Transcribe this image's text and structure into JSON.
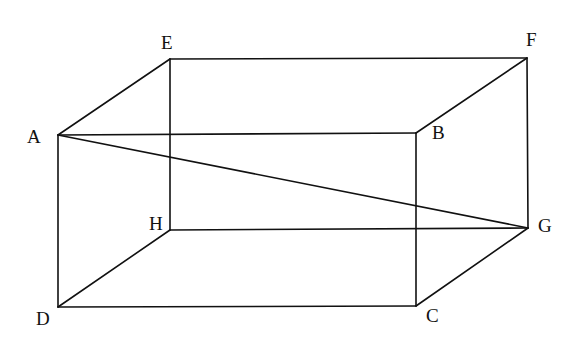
{
  "figure": {
    "type": "rectangular-prism",
    "stroke_color": "#111111",
    "background": "#ffffff"
  },
  "vertices": [
    {
      "name": "A",
      "x": 58,
      "y": 135,
      "label_x": 27,
      "label_y": 143
    },
    {
      "name": "B",
      "x": 416,
      "y": 133,
      "label_x": 432,
      "label_y": 139
    },
    {
      "name": "C",
      "x": 416,
      "y": 306,
      "label_x": 426,
      "label_y": 322
    },
    {
      "name": "D",
      "x": 58,
      "y": 307,
      "label_x": 36,
      "label_y": 325
    },
    {
      "name": "E",
      "x": 170,
      "y": 59,
      "label_x": 161,
      "label_y": 49
    },
    {
      "name": "F",
      "x": 527,
      "y": 58,
      "label_x": 526,
      "label_y": 46
    },
    {
      "name": "G",
      "x": 528,
      "y": 228,
      "label_x": 538,
      "label_y": 232
    },
    {
      "name": "H",
      "x": 170,
      "y": 230,
      "label_x": 149,
      "label_y": 230
    }
  ],
  "edges": [
    [
      "A",
      "B"
    ],
    [
      "B",
      "C"
    ],
    [
      "C",
      "D"
    ],
    [
      "D",
      "A"
    ],
    [
      "E",
      "F"
    ],
    [
      "F",
      "G"
    ],
    [
      "G",
      "H"
    ],
    [
      "H",
      "E"
    ],
    [
      "A",
      "E"
    ],
    [
      "B",
      "F"
    ],
    [
      "C",
      "G"
    ],
    [
      "D",
      "H"
    ],
    [
      "A",
      "G"
    ]
  ],
  "labels": {
    "A": "A",
    "B": "B",
    "C": "C",
    "D": "D",
    "E": "E",
    "F": "F",
    "G": "G",
    "H": "H"
  }
}
